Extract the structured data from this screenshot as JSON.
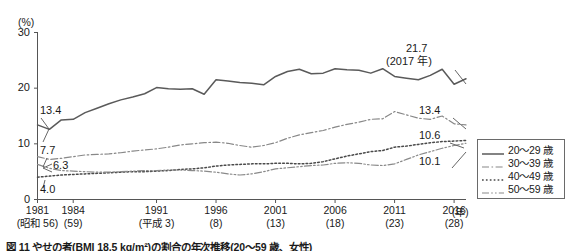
{
  "axis": {
    "unit_label": "(%)",
    "y_ticks": [
      "30",
      "20",
      "10",
      "0"
    ],
    "x_unit": "(年)",
    "x_ticks": [
      {
        "top": "1981",
        "bottom": "(昭和 56)"
      },
      {
        "top": "1984",
        "bottom": "(59)"
      },
      {
        "top": "1991",
        "bottom": "(平成 3)"
      },
      {
        "top": "1996",
        "bottom": "(8)"
      },
      {
        "top": "2001",
        "bottom": "(13)"
      },
      {
        "top": "2006",
        "bottom": "(18)"
      },
      {
        "top": "2011",
        "bottom": "(23)"
      },
      {
        "top": "2016",
        "bottom": "(28)"
      }
    ]
  },
  "annotations": {
    "start_20_29": "13.4",
    "start_30_39": "7.7",
    "start_50_59": "6.3",
    "start_40_49": "4.0",
    "end_20_29_value": "21.7",
    "end_20_29_year": "(2017 年)",
    "end_30_39": "13.4",
    "end_40_49": "10.6",
    "end_50_59": "10.1"
  },
  "legend": {
    "items": [
      {
        "label": "20〜29 歳",
        "style": "solid"
      },
      {
        "label": "30〜39 歳",
        "style": "dash-dot"
      },
      {
        "label": "40〜49 歳",
        "style": "dotted"
      },
      {
        "label": "50〜59 歳",
        "style": "dash-dot-dot"
      }
    ]
  },
  "caption": {
    "text": "図 11 やせの者(BMI 18.5 kg/m²)の割合の年次推移(20〜59 歳、女性)"
  },
  "chart_data": {
    "type": "line",
    "title": "",
    "xlabel": "(年)",
    "ylabel": "(%)",
    "ylim": [
      0,
      30
    ],
    "xlim": [
      1981,
      2017
    ],
    "grid": false,
    "legend_position": "right",
    "x": [
      1981,
      1982,
      1983,
      1984,
      1985,
      1986,
      1987,
      1988,
      1989,
      1990,
      1991,
      1992,
      1993,
      1994,
      1995,
      1996,
      1997,
      1998,
      1999,
      2000,
      2001,
      2002,
      2003,
      2004,
      2005,
      2006,
      2007,
      2008,
      2009,
      2010,
      2011,
      2012,
      2013,
      2014,
      2015,
      2016,
      2017
    ],
    "series": [
      {
        "name": "20〜29 歳",
        "style": "solid",
        "values": [
          13.4,
          12.6,
          14.3,
          14.4,
          15.6,
          16.4,
          17.2,
          17.9,
          18.4,
          19.0,
          20.1,
          19.9,
          19.8,
          19.9,
          18.9,
          21.5,
          21.3,
          21.0,
          20.9,
          20.6,
          22.1,
          23.0,
          23.4,
          22.6,
          22.7,
          23.5,
          23.3,
          23.2,
          22.7,
          23.5,
          22.1,
          21.8,
          21.5,
          22.3,
          23.4,
          20.7,
          21.7
        ]
      },
      {
        "name": "30〜39 歳",
        "style": "dash-dot",
        "values": [
          7.7,
          7.2,
          7.4,
          7.7,
          8.0,
          8.1,
          8.2,
          8.4,
          8.7,
          8.9,
          9.1,
          9.4,
          9.8,
          10.0,
          10.2,
          10.3,
          10.1,
          9.7,
          9.4,
          9.7,
          10.2,
          11.0,
          11.6,
          12.0,
          12.4,
          13.0,
          13.5,
          13.9,
          14.4,
          14.5,
          15.8,
          15.2,
          14.6,
          14.4,
          15.0,
          13.6,
          13.4
        ]
      },
      {
        "name": "40〜49 歳",
        "style": "dotted",
        "values": [
          4.0,
          4.2,
          4.4,
          4.5,
          4.6,
          4.7,
          4.8,
          4.9,
          5.0,
          5.0,
          5.1,
          5.2,
          5.4,
          5.5,
          5.7,
          6.0,
          6.2,
          6.3,
          6.4,
          6.4,
          6.5,
          6.5,
          6.4,
          6.5,
          6.8,
          7.3,
          7.8,
          8.2,
          8.6,
          8.8,
          9.4,
          9.6,
          9.9,
          10.2,
          10.4,
          10.5,
          10.6
        ]
      },
      {
        "name": "50〜59 歳",
        "style": "dash-dot-dot",
        "values": [
          6.3,
          5.6,
          5.2,
          5.1,
          5.0,
          4.9,
          4.9,
          5.0,
          5.1,
          5.2,
          5.2,
          5.3,
          5.3,
          5.2,
          5.1,
          4.9,
          4.6,
          4.4,
          4.6,
          5.0,
          5.5,
          5.7,
          5.9,
          6.1,
          6.2,
          6.5,
          6.6,
          6.5,
          6.2,
          6.1,
          6.4,
          7.2,
          8.0,
          8.6,
          9.2,
          9.7,
          10.1
        ]
      }
    ]
  }
}
